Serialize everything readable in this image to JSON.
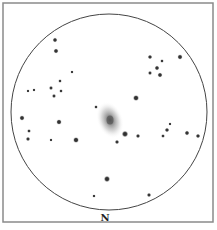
{
  "sketch": {
    "orientation_label": "N",
    "colors": {
      "background": "#ffffff",
      "frame": "#8a8a8a",
      "field_circle": "#444444",
      "star": "#333333",
      "galaxy_core": "#555555"
    },
    "frame": {
      "x": 3,
      "y": 3,
      "width": 210,
      "height": 219
    },
    "field_of_view": {
      "cx": 109,
      "cy": 112,
      "r": 98
    },
    "galaxy": {
      "cx": 110,
      "cy": 120,
      "rx": 13,
      "ry": 19,
      "rotation": -20
    },
    "stars": [
      {
        "x": 55,
        "y": 40,
        "r": 1.6
      },
      {
        "x": 56,
        "y": 51,
        "r": 1.7
      },
      {
        "x": 150,
        "y": 57,
        "r": 1.5
      },
      {
        "x": 162,
        "y": 61,
        "r": 1.1
      },
      {
        "x": 180,
        "y": 57,
        "r": 1.8
      },
      {
        "x": 157,
        "y": 68,
        "r": 1.6
      },
      {
        "x": 150,
        "y": 73,
        "r": 1.3
      },
      {
        "x": 160,
        "y": 75,
        "r": 1.7
      },
      {
        "x": 72,
        "y": 72,
        "r": 0.9
      },
      {
        "x": 60,
        "y": 81,
        "r": 1.1
      },
      {
        "x": 51,
        "y": 88,
        "r": 1.3
      },
      {
        "x": 61,
        "y": 91,
        "r": 1.1
      },
      {
        "x": 54,
        "y": 96,
        "r": 1.3
      },
      {
        "x": 28,
        "y": 91,
        "r": 0.8
      },
      {
        "x": 34,
        "y": 90,
        "r": 0.8
      },
      {
        "x": 136,
        "y": 98,
        "r": 2.2
      },
      {
        "x": 96,
        "y": 107,
        "r": 1.1
      },
      {
        "x": 22,
        "y": 118,
        "r": 1.8
      },
      {
        "x": 59,
        "y": 122,
        "r": 1.9
      },
      {
        "x": 29,
        "y": 131,
        "r": 1.2
      },
      {
        "x": 28,
        "y": 139,
        "r": 1.4
      },
      {
        "x": 51,
        "y": 140,
        "r": 0.8
      },
      {
        "x": 76,
        "y": 140,
        "r": 2.1
      },
      {
        "x": 125,
        "y": 134,
        "r": 2.4
      },
      {
        "x": 117,
        "y": 142,
        "r": 1.4
      },
      {
        "x": 138,
        "y": 136,
        "r": 1.4
      },
      {
        "x": 163,
        "y": 136,
        "r": 1.2
      },
      {
        "x": 167,
        "y": 130,
        "r": 1.5
      },
      {
        "x": 170,
        "y": 124,
        "r": 0.8
      },
      {
        "x": 187,
        "y": 133,
        "r": 1.6
      },
      {
        "x": 198,
        "y": 136,
        "r": 1.5
      },
      {
        "x": 107,
        "y": 179,
        "r": 2.3
      },
      {
        "x": 94,
        "y": 196,
        "r": 1.0
      },
      {
        "x": 149,
        "y": 195,
        "r": 1.4
      }
    ]
  }
}
